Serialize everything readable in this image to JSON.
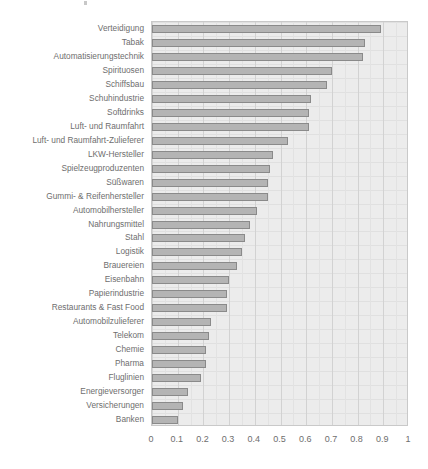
{
  "chart_data": {
    "type": "bar",
    "orientation": "horizontal",
    "title": "",
    "subtitle": "",
    "xlabel": "",
    "ylabel": "",
    "xlim": [
      0,
      1
    ],
    "ylim": null,
    "grid": true,
    "legend": null,
    "legend_position": "none",
    "xticks": [
      "0",
      "0.1",
      "0.2",
      "0.3",
      "0.4",
      "0.5",
      "0.6",
      "0.7",
      "0.8",
      "0.9",
      "1"
    ],
    "xtick_values": [
      0,
      0.1,
      0.2,
      0.3,
      0.4,
      0.5,
      0.6,
      0.7,
      0.8,
      0.9,
      1
    ],
    "categories": [
      "Verteidigung",
      "Tabak",
      "Automatisierungstechnik",
      "Spirituosen",
      "Schiffsbau",
      "Schuhindustrie",
      "Softdrinks",
      "Luft- und Raumfahrt",
      "Luft- und Raumfahrt-Zulieferer",
      "LKW-Hersteller",
      "Spielzeugproduzenten",
      "Süßwaren",
      "Gummi- & Reifenhersteller",
      "Automobilhersteller",
      "Nahrungsmittel",
      "Stahl",
      "Logistik",
      "Brauereien",
      "Eisenbahn",
      "Papierindustrie",
      "Restaurants & Fast Food",
      "Automobilzulieferer",
      "Telekom",
      "Chemie",
      "Pharma",
      "Fluglinien",
      "Energieversorger",
      "Versicherungen",
      "Banken"
    ],
    "values": [
      0.89,
      0.83,
      0.82,
      0.7,
      0.68,
      0.62,
      0.61,
      0.61,
      0.53,
      0.47,
      0.46,
      0.45,
      0.45,
      0.41,
      0.38,
      0.36,
      0.35,
      0.33,
      0.3,
      0.29,
      0.29,
      0.23,
      0.22,
      0.21,
      0.21,
      0.19,
      0.14,
      0.12,
      0.1
    ],
    "colors": {
      "bar_fill": "#b4b4b4",
      "bar_edge": "#8a8a8a",
      "panel_background": "#ececec",
      "gridline": "#d2d2d2",
      "text": "#6e6e6e"
    }
  }
}
